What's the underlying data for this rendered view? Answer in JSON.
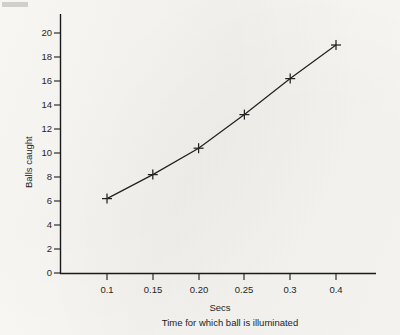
{
  "chart_data": {
    "type": "line",
    "title": "",
    "subtitle": "",
    "xlabel": "Secs",
    "xlabel_secondary": "Time for which ball is illuminated",
    "ylabel": "Balls caught",
    "categories": [
      "0.1",
      "0.15",
      "0.20",
      "0.25",
      "0.3",
      "0.4"
    ],
    "x": [
      0.1,
      0.15,
      0.2,
      0.25,
      0.3,
      0.4
    ],
    "values": [
      6.2,
      8.2,
      10.4,
      13.2,
      16.2,
      19.0
    ],
    "series": [
      {
        "name": "Balls caught",
        "values": [
          6.2,
          8.2,
          10.4,
          13.2,
          16.2,
          19.0
        ]
      }
    ],
    "ylim": [
      0,
      21
    ],
    "ytick_labels": [
      "0",
      "2",
      "4",
      "6",
      "8",
      "10",
      "12",
      "14",
      "16",
      "18",
      "20"
    ],
    "yticks": [
      0,
      2,
      4,
      6,
      8,
      10,
      12,
      14,
      16,
      18,
      20
    ],
    "xtick_labels": [
      "0.1",
      "0.15",
      "0.20",
      "0.25",
      "0.3",
      "0.4"
    ],
    "grid": false,
    "legend": "none",
    "marker": "plus",
    "line_color": "#222222",
    "marker_color": "#222222",
    "axis_color": "#1a1a1a",
    "background_color": "#f7f6f2",
    "x_axis_scale": "categorical-even-spacing",
    "annotations": []
  },
  "figure": {
    "alt": "Line graph of balls caught against time for which ball is illuminated"
  }
}
